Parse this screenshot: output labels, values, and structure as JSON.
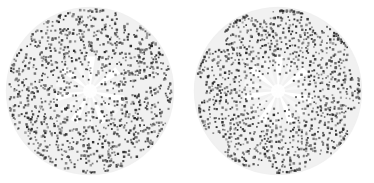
{
  "figure": {
    "type": "point-distribution-pair",
    "width": 374,
    "height": 183,
    "background_color": "#ffffff",
    "panel_count": 2,
    "caption": ""
  },
  "style": {
    "disk_fill": "#f1f1f1",
    "disk_edge": "#e4e4e4",
    "point_color": "#2b2b2b",
    "point_color_light": "#6e6e6e",
    "spoke_color": "#e6e6e6",
    "core_color": "#fbfbfb",
    "point_radius": 0.95,
    "spoke_count": 14
  },
  "chart_data": [
    {
      "type": "scatter",
      "name": "left-panel",
      "title": "",
      "subtitle": "",
      "xlabel": "",
      "ylabel": "",
      "grid": false,
      "legend": null,
      "annotations": [],
      "projection": "polar",
      "domain_shape": "disk",
      "center": [
        90,
        91
      ],
      "radius": 83,
      "inner_blank_radius": 9,
      "point_count": 1150,
      "arrangement": "jittered-phyllotaxis",
      "lobes": 9,
      "lobe_amplitude": 0.115,
      "jitter_radial": 0.052,
      "jitter_angular": 0.085,
      "golden_angle_deg": 137.508,
      "radial_exponent": 0.5,
      "density_profile": "uniform-area",
      "rlim": [
        0,
        83
      ],
      "theta_lim_deg": [
        0,
        360
      ],
      "seed": 17
    },
    {
      "type": "scatter",
      "name": "right-panel",
      "title": "",
      "subtitle": "",
      "xlabel": "",
      "ylabel": "",
      "grid": false,
      "legend": null,
      "annotations": [],
      "projection": "polar",
      "domain_shape": "disk",
      "center": [
        278,
        91
      ],
      "radius": 83,
      "inner_blank_radius": 14,
      "point_count": 1150,
      "arrangement": "ordered-concentric-lobes",
      "lobes": 9,
      "lobe_amplitude": 0.175,
      "jitter_radial": 0.012,
      "jitter_angular": 0.016,
      "golden_angle_deg": 137.508,
      "radial_exponent": 0.5,
      "density_profile": "uniform-area",
      "rlim": [
        0,
        83
      ],
      "theta_lim_deg": [
        0,
        360
      ],
      "seed": 42
    }
  ]
}
